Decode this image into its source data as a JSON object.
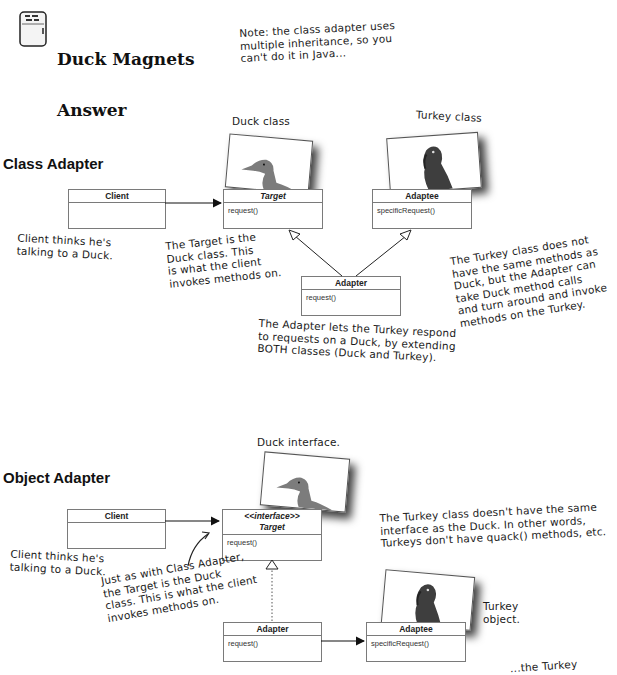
{
  "header": {
    "title_line1": "Duck Magnets",
    "title_line2": "Answer",
    "icon": "fridge-icon",
    "note": "Note: the class adapter uses\nmultiple inheritance, so you\ncan't do it in Java..."
  },
  "class_adapter": {
    "section_title": "Class Adapter",
    "duck_label": "Duck class",
    "turkey_label": "Turkey class",
    "client": {
      "name": "Client",
      "methods": []
    },
    "target": {
      "name": "Target",
      "methods": [
        "request()"
      ]
    },
    "adaptee": {
      "name": "Adaptee",
      "methods": [
        "specificRequest()"
      ]
    },
    "adapter": {
      "name": "Adapter",
      "methods": [
        "request()"
      ]
    },
    "notes": {
      "client": "Client thinks he's\ntalking to a Duck.",
      "target": "The Target is the\nDuck class. This\nis what the client\ninvokes methods on.",
      "adapter": "The Adapter lets the Turkey respond\nto requests on a Duck, by extending\nBOTH classes (Duck and Turkey).",
      "turkey": "The Turkey class does not\nhave the same methods as\nDuck, but the Adapter can\ntake Duck method calls\nand turn around and invoke\nmethods on the Turkey."
    }
  },
  "object_adapter": {
    "section_title": "Object Adapter",
    "duck_label": "Duck interface.",
    "turkey_label": "Turkey\nobject.",
    "client": {
      "name": "Client",
      "methods": []
    },
    "target": {
      "stereotype": "<<interface>>",
      "name": "Target",
      "methods": [
        "request()"
      ]
    },
    "adapter": {
      "name": "Adapter",
      "methods": [
        "request()"
      ]
    },
    "adaptee": {
      "name": "Adaptee",
      "methods": [
        "specificRequest()"
      ]
    },
    "notes": {
      "client": "Client thinks he's\ntalking to a Duck.",
      "target": "Just as with Class Adapter,\nthe Target is the Duck\nclass. This is what the client\ninvokes methods on.",
      "turkey": "The Turkey class doesn't have the same\ninterface as the Duck. In other words,\nTurkeys don't have quack() methods, etc.",
      "cutoff": "...the Turkey"
    }
  }
}
